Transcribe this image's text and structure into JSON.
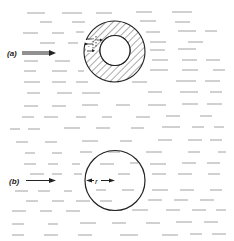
{
  "figure": {
    "panel_a": {
      "label": "(a)",
      "description": "Hollow annular body (hatched ring) in uniform flow with local flow detail near inner boundary"
    },
    "panel_b": {
      "label": "(b)",
      "radius_label": "r",
      "description": "Circle of radius r in uniform flow"
    }
  },
  "colors": {
    "ink": "#222222",
    "streak": "#8a8a8a",
    "background": "#ffffff"
  }
}
